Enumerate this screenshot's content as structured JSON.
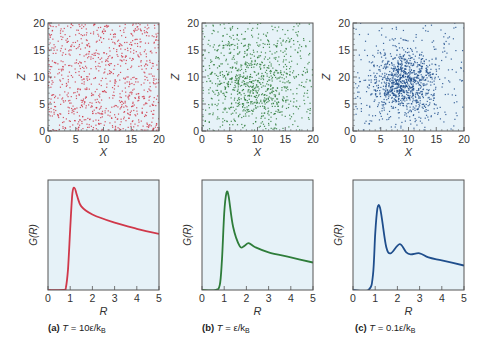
{
  "figure": {
    "panels": [
      {
        "id": "a",
        "caption_label": "(a)",
        "caption_T": "T",
        "caption_eq": " = 10ε/k",
        "caption_sub": "B",
        "color": "#d0384a",
        "scatter_spread": "uniform",
        "scatter_center": [
          10,
          10
        ],
        "scatter_sigma": 0,
        "scatter_n": 900
      },
      {
        "id": "b",
        "caption_label": "(b)",
        "caption_T": "T",
        "caption_eq": " = ε/k",
        "caption_sub": "B",
        "color": "#2e7d3a",
        "scatter_spread": "mixed",
        "scatter_center": [
          9,
          9
        ],
        "scatter_sigma": 4.2,
        "scatter_n": 1000
      },
      {
        "id": "c",
        "caption_label": "(c)",
        "caption_T": "T",
        "caption_eq": " = 0.1ε/k",
        "caption_sub": "B",
        "color": "#1f4e8c",
        "scatter_spread": "cluster",
        "scatter_center": [
          9,
          9
        ],
        "scatter_sigma": 3.0,
        "scatter_n": 1100
      }
    ]
  },
  "chart_data": [
    {
      "type": "scatter",
      "title": "(a) T = 10ε/kB",
      "xlabel": "X",
      "ylabel": "Z",
      "xlim": [
        0,
        20
      ],
      "ylim": [
        0,
        20
      ],
      "xticks": [
        "0",
        "5",
        "10",
        "15",
        "20"
      ],
      "yticks": [
        "0",
        "5",
        "10",
        "15",
        "20"
      ],
      "description": "Particles uniformly distributed (gas-like)",
      "color": "#d0384a"
    },
    {
      "type": "scatter",
      "title": "(b) T = ε/kB",
      "xlabel": "X",
      "ylabel": "Z",
      "xlim": [
        0,
        20
      ],
      "ylim": [
        0,
        20
      ],
      "xticks": [
        "0",
        "5",
        "10",
        "15",
        "20"
      ],
      "yticks": [
        "0",
        "5",
        "10",
        "15",
        "20"
      ],
      "description": "Particles loosely clustered around (9,9) (liquid-like)",
      "color": "#2e7d3a"
    },
    {
      "type": "scatter",
      "title": "(c) T = 0.1ε/kB",
      "xlabel": "X",
      "ylabel": "Z",
      "xlim": [
        0,
        20
      ],
      "ylim": [
        0,
        20
      ],
      "xticks": [
        "0",
        "5",
        "10",
        "15",
        "20"
      ],
      "yticks": [
        "0",
        "5",
        "20",
        "15",
        "20"
      ],
      "description": "Particles densely clustered around (9,9) with sparse outliers",
      "color": "#1f4e8c"
    },
    {
      "type": "line",
      "title": "(a) T = 10ε/kB",
      "xlabel": "R",
      "ylabel": "G(R)",
      "xlim": [
        0,
        5
      ],
      "xticks": [
        "0",
        "1",
        "2",
        "3",
        "4",
        "5"
      ],
      "color": "#d0384a",
      "x": [
        0.7,
        0.8,
        0.9,
        1.0,
        1.1,
        1.2,
        1.3,
        1.5,
        2.0,
        3.0,
        4.0,
        5.0
      ],
      "y": [
        0.0,
        0.02,
        0.2,
        0.6,
        0.95,
        1.0,
        0.93,
        0.82,
        0.74,
        0.66,
        0.6,
        0.55
      ]
    },
    {
      "type": "line",
      "title": "(b) T = ε/kB",
      "xlabel": "R",
      "ylabel": "G(R)",
      "xlim": [
        0,
        5
      ],
      "xticks": [
        "0",
        "1",
        "2",
        "3",
        "4",
        "5"
      ],
      "color": "#2e7d3a",
      "x": [
        0.6,
        0.8,
        0.9,
        1.0,
        1.1,
        1.2,
        1.4,
        1.7,
        1.9,
        2.1,
        2.4,
        3.0,
        4.0,
        5.0
      ],
      "y": [
        0.0,
        0.05,
        0.3,
        0.75,
        0.95,
        0.92,
        0.62,
        0.43,
        0.43,
        0.46,
        0.42,
        0.37,
        0.32,
        0.27
      ],
      "note": "normalized to peak ≈ 0.95 of plot height"
    },
    {
      "type": "line",
      "title": "(c) T = 0.1ε/kB",
      "xlabel": "R",
      "ylabel": "G(R)",
      "xlim": [
        0,
        5
      ],
      "xticks": [
        "0",
        "1",
        "2",
        "3",
        "4",
        "5"
      ],
      "color": "#1f4e8c",
      "x": [
        0.7,
        0.9,
        1.0,
        1.1,
        1.2,
        1.3,
        1.5,
        1.7,
        2.1,
        2.4,
        2.6,
        3.0,
        3.4,
        4.0,
        5.0
      ],
      "y": [
        0.0,
        0.15,
        0.55,
        0.8,
        0.82,
        0.7,
        0.42,
        0.36,
        0.45,
        0.37,
        0.35,
        0.36,
        0.32,
        0.29,
        0.24
      ]
    }
  ]
}
